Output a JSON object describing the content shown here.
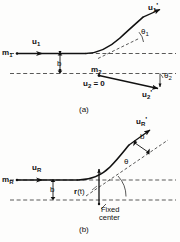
{
  "figure": {
    "type": "physics-scattering-diagram",
    "background_color": "#fdfdfc",
    "stroke_color": "#111111",
    "panels": [
      {
        "id": "a",
        "caption": "(a)",
        "description": "Two-body scattering in the laboratory frame: incident mass m1 with velocity u1 and impact parameter b scatters off stationary mass m2; after collision m1 moves with u1' at angle theta1 and m2 recoils with u2' at angle theta2.",
        "labels": {
          "mass1": "m",
          "mass1_sub": "1",
          "mass2": "m",
          "mass2_sub": "2",
          "u1": "u",
          "u1_sub": "1",
          "u1_prime": "u",
          "u1_prime_sub": "1",
          "u1_prime_mark": "'",
          "u2_zero": "u",
          "u2_zero_sub": "2",
          "u2_zero_eq": "= 0",
          "u2_prime": "u",
          "u2_prime_sub": "2",
          "u2_prime_mark": "'",
          "impact_parameter": "b",
          "theta1": "θ",
          "theta1_sub": "1",
          "theta2": "θ",
          "theta2_sub": "2"
        }
      },
      {
        "id": "b",
        "caption": "(b)",
        "description": "Equivalent one-body problem: reduced mass mR with incident velocity uR and impact parameter b is deflected through angle theta by a fixed center; position vector r(t) points from the fixed center to the particle, outgoing velocity uR'.",
        "labels": {
          "massR": "m",
          "massR_sub": "R",
          "uR": "u",
          "uR_sub": "R",
          "uR_prime": "u",
          "uR_prime_sub": "R",
          "uR_prime_mark": "'",
          "impact_parameter": "b",
          "impact_parameter_upper": "b",
          "theta": "θ",
          "r_of_t": "r",
          "r_of_t_arg": "(t)",
          "fixed_center_line1": "Fixed",
          "fixed_center_line2": "center"
        }
      }
    ]
  }
}
